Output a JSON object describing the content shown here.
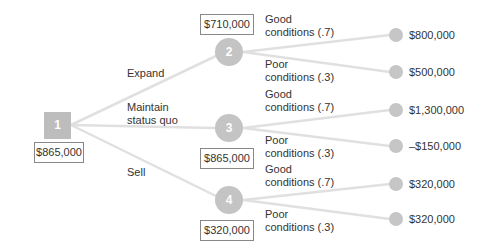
{
  "diagram": {
    "type": "decision-tree",
    "colors": {
      "node": "#c4c4c4",
      "line": "#e2e2e2",
      "text": "#333333",
      "box_border": "#888888"
    },
    "decision_node": {
      "id": "1",
      "value": "$865,000"
    },
    "branches": [
      {
        "label": "Expand",
        "node_id": "2",
        "value": "$710,000",
        "outcomes": [
          {
            "label_line1": "Good",
            "label_line2": "conditions (.7)",
            "payoff": "$800,000"
          },
          {
            "label_line1": "Poor",
            "label_line2": "conditions (.3)",
            "payoff": "$500,000"
          }
        ]
      },
      {
        "label_line1": "Maintain",
        "label_line2": "status quo",
        "node_id": "3",
        "value": "$865,000",
        "outcomes": [
          {
            "label_line1": "Good",
            "label_line2": "conditions (.7)",
            "payoff": "$1,300,000"
          },
          {
            "label_line1": "Poor",
            "label_line2": "conditions (.3)",
            "payoff": "–$150,000"
          }
        ]
      },
      {
        "label": "Sell",
        "node_id": "4",
        "value": "$320,000",
        "outcomes": [
          {
            "label_line1": "Good",
            "label_line2": "conditions (.7)",
            "payoff": "$320,000"
          },
          {
            "label_line1": "Poor",
            "label_line2": "conditions (.3)",
            "payoff": "$320,000"
          }
        ]
      }
    ]
  }
}
